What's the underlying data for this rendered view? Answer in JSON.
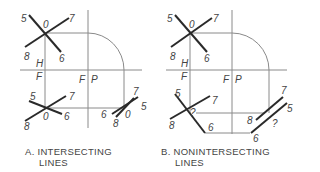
{
  "figure": {
    "panels": [
      {
        "id": "A",
        "caption_line1": "A. INTERSECTING",
        "caption_line2": "LINES",
        "labels": {
          "top_5": "5",
          "top_0": "0",
          "top_7": "7",
          "top_8": "8",
          "top_6": "6",
          "H": "H",
          "F_left": "F",
          "F_mid": "F",
          "P": "P",
          "bl_5": "5",
          "bl_7": "7",
          "bl_8": "8",
          "bl_0": "0",
          "bl_6": "6",
          "br_7": "7",
          "br_5": "5",
          "br_6": "6",
          "br_0": "0",
          "br_8": "8"
        }
      },
      {
        "id": "B",
        "caption_line1": "B. NONINTERSECTING",
        "caption_line2": "LINES",
        "labels": {
          "top_5": "5",
          "top_0": "0",
          "top_7": "7",
          "top_8": "8",
          "top_6": "6",
          "H": "H",
          "F_left": "F",
          "F_mid": "F",
          "P": "P",
          "bl_5": "5",
          "bl_7": "7",
          "bl_8": "8",
          "bl_q": "?",
          "bl_6": "6",
          "br_7": "7",
          "br_5": "5",
          "br_8": "8",
          "br_q": "?",
          "br_6": "6"
        }
      }
    ],
    "colors": {
      "thin_line": "#8a8a8a",
      "thick_line": "#2a2a2a",
      "text": "#444444"
    }
  }
}
